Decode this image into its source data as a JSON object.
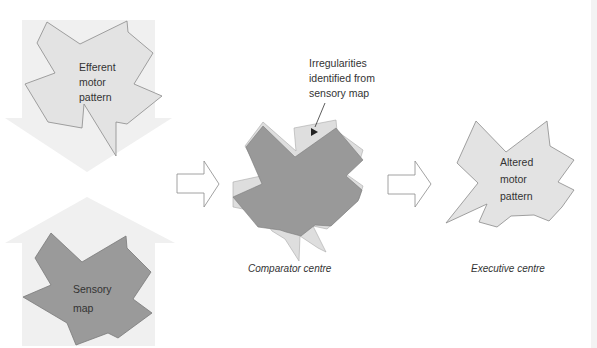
{
  "diagram": {
    "colors": {
      "background": "#ffffff",
      "block_arrow_fill": "#efefef",
      "light_shape_fill": "#e2e2e2",
      "dark_shape_fill": "#999999",
      "outline": "#8a8a8a",
      "text": "#333333"
    },
    "nodes": {
      "efferent": {
        "line1": "Efferent",
        "line2": "motor",
        "line3": "pattern"
      },
      "sensory": {
        "line1": "Sensory",
        "line2": "map"
      },
      "irregularities": {
        "line1": "Irregularities",
        "line2": "identified from",
        "line3": "sensory map"
      },
      "altered": {
        "line1": "Altered",
        "line2": "motor",
        "line3": "pattern"
      }
    },
    "captions": {
      "comparator": "Comparator centre",
      "executive": "Executive centre"
    },
    "flow": [
      {
        "from": "efferent",
        "to": "comparator",
        "direction": "down"
      },
      {
        "from": "sensory",
        "to": "comparator",
        "direction": "up"
      },
      {
        "from": "comparator",
        "to": "executive",
        "direction": "right"
      }
    ]
  }
}
